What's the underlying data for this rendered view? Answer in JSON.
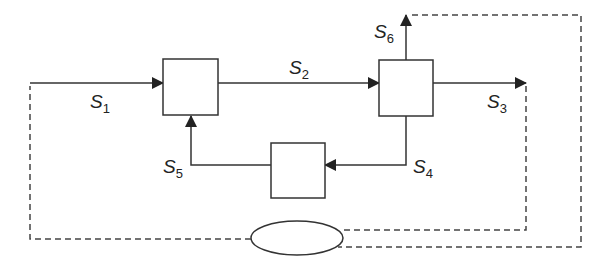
{
  "diagram": {
    "type": "process-flow-block-diagram",
    "stroke_color": "#333333",
    "background": "#ffffff",
    "nodes": [
      {
        "id": "unit-1",
        "shape": "square",
        "label": ""
      },
      {
        "id": "unit-2",
        "shape": "square",
        "label": ""
      },
      {
        "id": "unit-3",
        "shape": "square",
        "label": ""
      },
      {
        "id": "controller",
        "shape": "ellipse",
        "label": ""
      }
    ],
    "streams": [
      {
        "id": "S1",
        "base": "S",
        "sub": "1",
        "from": "feed",
        "to": "unit-1",
        "style": "solid"
      },
      {
        "id": "S2",
        "base": "S",
        "sub": "2",
        "from": "unit-1",
        "to": "unit-2",
        "style": "solid"
      },
      {
        "id": "S3",
        "base": "S",
        "sub": "3",
        "from": "unit-2",
        "to": "product",
        "style": "solid"
      },
      {
        "id": "S4",
        "base": "S",
        "sub": "4",
        "from": "unit-2",
        "to": "unit-3",
        "style": "solid"
      },
      {
        "id": "S5",
        "base": "S",
        "sub": "5",
        "from": "unit-3",
        "to": "unit-1",
        "style": "solid"
      },
      {
        "id": "S6",
        "base": "S",
        "sub": "6",
        "from": "unit-2",
        "to": "out",
        "style": "solid"
      }
    ],
    "signal_lines": [
      {
        "from": "S3",
        "to": "controller",
        "style": "dashed"
      },
      {
        "from": "S6",
        "to": "controller",
        "style": "dashed"
      },
      {
        "from": "controller",
        "to": "S1",
        "style": "dashed"
      }
    ]
  }
}
